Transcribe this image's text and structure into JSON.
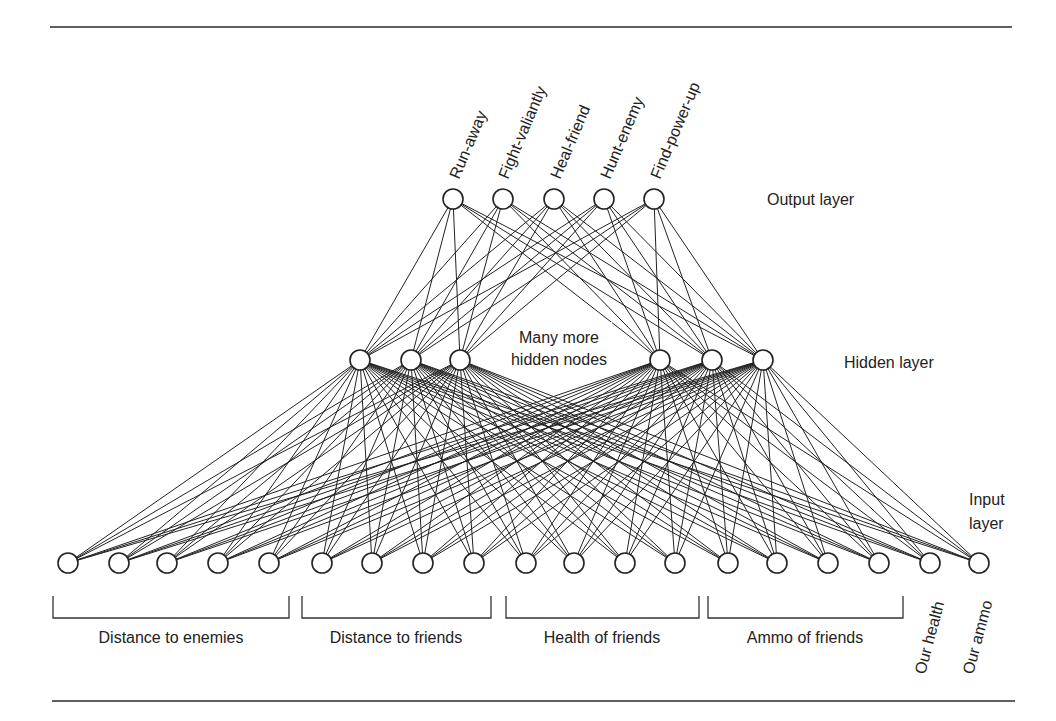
{
  "diagram": {
    "type": "neural-network",
    "layers": {
      "output": {
        "label": "Output layer",
        "nodes": [
          "Run-away",
          "Fight-valiantly",
          "Heal-friend",
          "Hunt-enemy",
          "Find-power-up"
        ]
      },
      "hidden": {
        "label": "Hidden layer",
        "annotation_line1": "Many more",
        "annotation_line2": "hidden nodes",
        "node_count_shown": 6
      },
      "input": {
        "label_line1": "Input",
        "label_line2": "layer",
        "node_count": 19,
        "groups": [
          {
            "label": "Distance to enemies",
            "count": 5
          },
          {
            "label": "Distance to friends",
            "count": 4
          },
          {
            "label": "Health of friends",
            "count": 4
          },
          {
            "label": "Ammo of friends",
            "count": 4
          }
        ],
        "single_inputs": [
          "Our health",
          "Our ammo"
        ]
      }
    },
    "connections": "fully-connected between adjacent layers",
    "colors": {
      "line": "#222222",
      "node_fill": "#ffffff",
      "background": "#ffffff"
    }
  }
}
